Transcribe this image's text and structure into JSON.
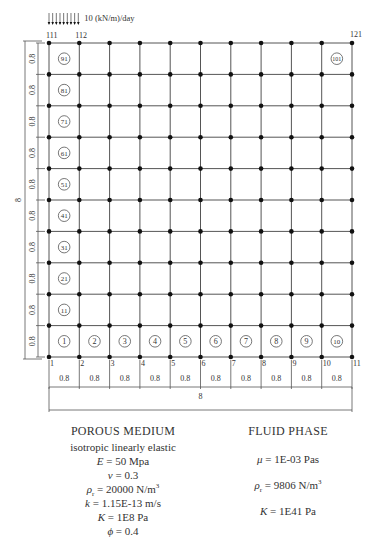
{
  "load": {
    "label": "10 (kN/m)/day",
    "arrow_count": 9,
    "from_node": "111",
    "to_node": "112"
  },
  "corner_nodes": {
    "top_left": "111",
    "top_second": "112",
    "top_right": "121"
  },
  "bottom_nodes": [
    "1",
    "2",
    "3",
    "4",
    "5",
    "6",
    "7",
    "8",
    "9",
    "10",
    "11"
  ],
  "grid": {
    "columns": 10,
    "rows": 10,
    "cell_size": "0.8",
    "x0": 49,
    "x1": 352,
    "y0": 43,
    "y1": 357
  },
  "element_labels": {
    "bottom_row": [
      "1",
      "2",
      "3",
      "4",
      "5",
      "6",
      "7",
      "8",
      "9",
      "10"
    ],
    "left_column": [
      "11",
      "21",
      "31",
      "41",
      "51",
      "61",
      "71",
      "81",
      "91"
    ],
    "top_right": "101"
  },
  "dimensions": {
    "vertical_segments": [
      "0.8",
      "0.8",
      "0.8",
      "0.8",
      "0.8",
      "0.8",
      "0.8",
      "0.8",
      "0.8",
      "0.8"
    ],
    "vertical_total": "8",
    "horizontal_segments": [
      "0.8",
      "0.8",
      "0.8",
      "0.8",
      "0.8",
      "0.8",
      "0.8",
      "0.8",
      "0.8",
      "0.8"
    ],
    "horizontal_total": "8"
  },
  "porous_medium": {
    "title": "POROUS MEDIUM",
    "subtitle": "isotropic linearly elastic",
    "E": {
      "sym": "E",
      "val": " = 50 Mpa"
    },
    "nu": {
      "sym": "ν",
      "val": " = 0.3"
    },
    "rho": {
      "sym": "ρ",
      "sub": "r",
      "val": " = 20000 N/m",
      "sup": "3"
    },
    "k": {
      "sym": "k",
      "val": " = 1.15E-13 m/s"
    },
    "K": {
      "sym": "K",
      "val": " = 1E8 Pa"
    },
    "phi": {
      "sym": "ϕ",
      "val": " = 0.4"
    }
  },
  "fluid_phase": {
    "title": "FLUID PHASE",
    "mu": {
      "sym": "μ",
      "val": " = 1E-03 Pas"
    },
    "rho": {
      "sym": "ρ",
      "sub": "r",
      "val": " = 9806 N/m",
      "sup": "3"
    },
    "K": {
      "sym": "K",
      "val": " = 1E41 Pa"
    }
  },
  "colors": {
    "line": "#555555",
    "node": "#111111",
    "text": "#333333"
  }
}
